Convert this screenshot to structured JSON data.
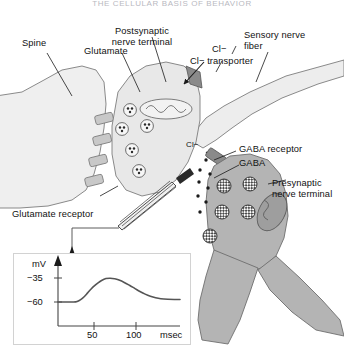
{
  "header": {
    "running_title": "THE CELLULAR BASIS OF BEHAVIOR"
  },
  "figure": {
    "labels": {
      "spine": "Spine",
      "glutamate": "Glutamate",
      "postsynaptic_nerve_terminal": "Postsynaptic\nnerve terminal",
      "postsynaptic_line1": "Postsynaptic",
      "postsynaptic_line2": "nerve terminal",
      "chloride_ion": "Cl−",
      "chloride_transporter": "Cl− transporter",
      "sensory_nerve_fiber_line1": "Sensory nerve",
      "sensory_nerve_fiber_line2": "fiber",
      "chloride_ion_inner": "Cl−",
      "gaba_receptor": "GABA receptor",
      "gaba": "GABA",
      "presynaptic_line1": "Presynaptic",
      "presynaptic_line2": "nerve terminal",
      "glutamate_receptor": "Glutamate receptor"
    },
    "colors": {
      "spine_fill": "#efefef",
      "postsynaptic_fill": "#e8e8e8",
      "sensory_fiber_fill": "#ededed",
      "presynaptic_fill": "#b4b4b4",
      "transporter_fill": "#8a8a8a",
      "receptor_fill": "#c8c8c8",
      "outline": "#6e6e6e",
      "electrode": "#3a3a3a",
      "trace": "#555555",
      "axis": "#444444"
    }
  },
  "chart_data": {
    "type": "line",
    "title": "",
    "xlabel": "msec",
    "ylabel": "mV",
    "xticks": [
      50,
      100
    ],
    "xtick_labels": [
      "50",
      "100"
    ],
    "yticks": [
      -35,
      -60
    ],
    "ytick_labels": [
      "−35",
      "−60"
    ],
    "xlim": [
      0,
      140
    ],
    "ylim": [
      -70,
      -20
    ],
    "grid": false,
    "legend": null,
    "series": [
      {
        "name": "EPSP membrane potential",
        "x": [
          0,
          10,
          18,
          22,
          26,
          30,
          34,
          38,
          42,
          46,
          50,
          55,
          60,
          65,
          70,
          76,
          82,
          88,
          94,
          100,
          106,
          112,
          118,
          126,
          134,
          140
        ],
        "y": [
          -60,
          -60,
          -60,
          -59.4,
          -57.5,
          -54.5,
          -50.5,
          -46.5,
          -43.0,
          -40.0,
          -37.6,
          -35.6,
          -35.2,
          -35.8,
          -37.2,
          -39.6,
          -42.6,
          -45.8,
          -49.0,
          -51.8,
          -54.0,
          -55.6,
          -56.6,
          -57.2,
          -57.4,
          -57.4
        ]
      }
    ]
  }
}
